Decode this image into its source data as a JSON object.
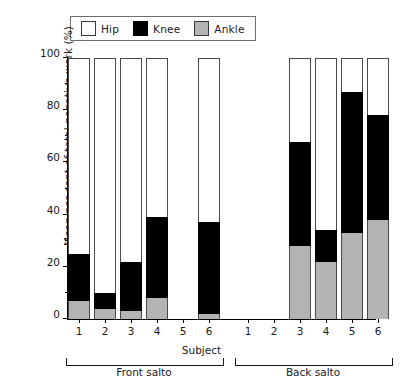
{
  "chart_data": {
    "type": "bar",
    "subtype": "stacked-vertical",
    "title": "",
    "xlabel": "Subject",
    "ylabel": "Mean per cent of total negative work (%)",
    "ylim": [
      0,
      100
    ],
    "yticks": [
      0,
      20,
      40,
      60,
      80,
      100
    ],
    "yticks_minor": [
      10,
      30,
      50,
      70,
      90
    ],
    "grid": false,
    "legend_position": "top",
    "stack_order_bottom_to_top": [
      "Ankle",
      "Knee",
      "Hip"
    ],
    "categories": [
      "1",
      "2",
      "3",
      "4",
      "5",
      "6",
      "1",
      "2",
      "3",
      "4",
      "5",
      "6"
    ],
    "groups": [
      {
        "name": "Front salto",
        "categories": [
          "1",
          "2",
          "3",
          "4",
          "5",
          "6"
        ]
      },
      {
        "name": "Back salto",
        "categories": [
          "1",
          "2",
          "3",
          "4",
          "5",
          "6"
        ]
      }
    ],
    "series": [
      {
        "name": "Ankle",
        "color": "#b3b3b3",
        "values": [
          7,
          4,
          3,
          8,
          null,
          2,
          null,
          null,
          28,
          22,
          33,
          38
        ]
      },
      {
        "name": "Knee",
        "color": "#000000",
        "values": [
          18,
          6,
          19,
          31,
          null,
          35,
          null,
          null,
          40,
          12,
          54,
          40
        ]
      },
      {
        "name": "Hip",
        "color": "#ffffff",
        "values": [
          75,
          90,
          78,
          61,
          null,
          63,
          null,
          null,
          32,
          66,
          13,
          22
        ]
      }
    ],
    "cumulative_tops": {
      "ankle": [
        7,
        4,
        3,
        8,
        null,
        2,
        null,
        null,
        28,
        22,
        33,
        38
      ],
      "knee": [
        25,
        10,
        22,
        39,
        null,
        37,
        null,
        null,
        68,
        34,
        87,
        78
      ],
      "hip": [
        100,
        100,
        100,
        100,
        null,
        100,
        null,
        null,
        100,
        100,
        100,
        100
      ]
    },
    "missing_bars": [
      "Front salto 5",
      "Back salto 1",
      "Back salto 2"
    ]
  },
  "legend": {
    "items": [
      {
        "label": "Hip",
        "color": "#ffffff",
        "swatch": "hip-swatch"
      },
      {
        "label": "Knee",
        "color": "#000000",
        "swatch": "knee-swatch"
      },
      {
        "label": "Ankle",
        "color": "#b3b3b3",
        "swatch": "ankle-swatch"
      }
    ]
  },
  "axes": {
    "y_title": "Mean per cent of total negative work (%)",
    "y_tick_labels": [
      "100",
      "80",
      "60",
      "40",
      "20",
      "0"
    ],
    "x_title": "Subject",
    "x_tick_labels": [
      "1",
      "2",
      "3",
      "4",
      "5",
      "6",
      "1",
      "2",
      "3",
      "4",
      "5",
      "6"
    ]
  },
  "group_labels": [
    {
      "text": "Front salto"
    },
    {
      "text": "Back salto"
    }
  ]
}
